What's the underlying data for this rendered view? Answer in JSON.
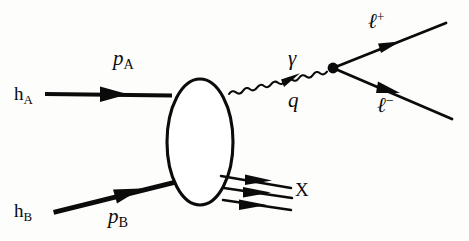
{
  "figure": {
    "kind": "feynman-diagram",
    "process_name": "Drell-Yan lepton pair production in hadron-hadron collision",
    "background_color": "#fdfdfb",
    "ink_color": "#0b0b0b"
  },
  "labels": {
    "hadron_a": {
      "base": "h",
      "sub": "A"
    },
    "momentum_a": {
      "base": "p",
      "sub": "A"
    },
    "hadron_b": {
      "base": "h",
      "sub": "B"
    },
    "momentum_b": {
      "base": "p",
      "sub": "B"
    },
    "photon": {
      "base": "γ"
    },
    "virtuality": {
      "base": "q"
    },
    "lepton_plus": {
      "base": "ℓ",
      "sup": "+"
    },
    "lepton_minus": {
      "base": "ℓ",
      "sup": "−"
    },
    "remnant": {
      "base": "X"
    }
  },
  "elements": {
    "blob": "soft-hadronic-blob-ellipse",
    "incoming_a": "thick-arrow-horizontal",
    "incoming_b": "thick-arrow-diagonal",
    "photon_line": "wavy-photon-propagator",
    "vertex": "interaction-vertex-dot",
    "outgoing_lplus": "thin-arrow-upper-right",
    "outgoing_lminus": "thin-arrow-lower-right",
    "remnant_lines": "three-thin-arrows"
  }
}
